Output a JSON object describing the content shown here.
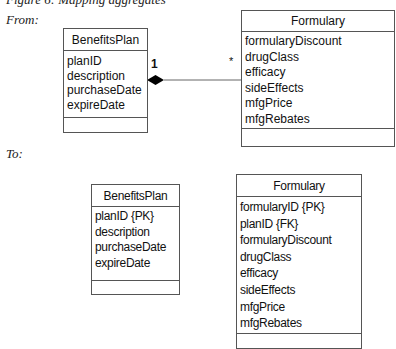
{
  "figure": {
    "title": "Figure 6: Mapping aggregates",
    "from_label": "From:",
    "to_label": "To:"
  },
  "from": {
    "benefits_plan": {
      "name": "BenefitsPlan",
      "attributes": [
        "planID",
        "description",
        "purchaseDate",
        "expireDate"
      ]
    },
    "formulary": {
      "name": "Formulary",
      "attributes": [
        "formularyDiscount",
        "drugClass",
        "efficacy",
        "sideEffects",
        "mfgPrice",
        "mfgRebates"
      ]
    },
    "association": {
      "type": "composition",
      "whole_multiplicity": "1",
      "part_multiplicity": "*"
    }
  },
  "to": {
    "benefits_plan": {
      "name": "BenefitsPlan",
      "attributes": [
        "planID {PK}",
        "description",
        "purchaseDate",
        "expireDate"
      ]
    },
    "formulary": {
      "name": "Formulary",
      "attributes": [
        "formularyID {PK}",
        "planID {FK}",
        "formularyDiscount",
        "drugClass",
        "efficacy",
        "sideEffects",
        "mfgPrice",
        "mfgRebates"
      ]
    }
  },
  "colors": {
    "line": "#555555",
    "diamond": "#000000",
    "text": "#111111"
  }
}
